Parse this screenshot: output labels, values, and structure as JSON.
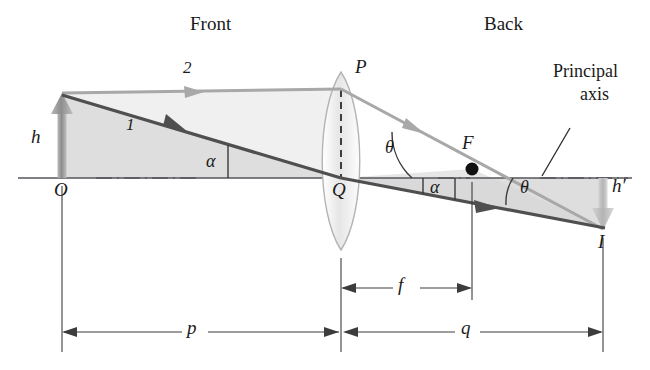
{
  "figure": {
    "type": "ray-diagram",
    "background_color": "#ffffff",
    "ink_color": "#1a1a1a"
  },
  "region_labels": {
    "front": "Front",
    "back": "Back"
  },
  "annotation": {
    "principal_axis_line1": "Principal",
    "principal_axis_line2": "axis"
  },
  "points": {
    "object_top_O_label": "O",
    "lens_top_P_label": "P",
    "lens_center_Q_label": "Q",
    "focal_F_label": "F",
    "image_I_label": "I"
  },
  "heights": {
    "object_h": "h",
    "image_h_prime": "h′"
  },
  "rays": {
    "ray1_label": "1",
    "ray2_label": "2",
    "ray1_color": "#5a5a5a",
    "ray2_color": "#a8a8a8"
  },
  "angles": {
    "alpha_front": "α",
    "theta_upper": "θ",
    "alpha_back": "α",
    "theta_lower": "θ"
  },
  "distances": {
    "object_distance_p": "p",
    "focal_length_f": "f",
    "image_distance_q": "q"
  },
  "colors": {
    "axis": "#55555b",
    "shade_fill": "#dcdcdc",
    "lens_stroke": "#b0b0b0",
    "lens_fill_light": "#f2f2f2",
    "lens_fill_mid": "#d8d8d8",
    "dimension_line": "#3c3c3c",
    "arrow_object": "#9a9a9a",
    "arrow_image": "#bdbdbd"
  },
  "geometry": {
    "axis_y": 178,
    "object_x": 62,
    "lens_x": 341,
    "focal_x": 472,
    "image_x": 603,
    "object_top_y": 95,
    "image_bottom_y": 228,
    "ray_P_y": 88
  }
}
